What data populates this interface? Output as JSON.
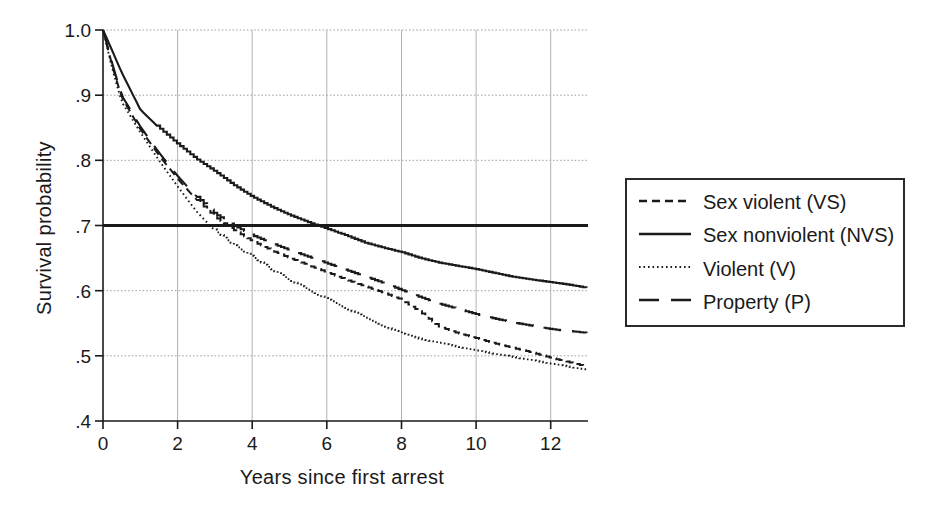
{
  "figure": {
    "colors": {
      "ink": "#1a1a1a",
      "grid_vertical": "#b2b2b2",
      "grid_horizontal": "#9a9a9a",
      "background": "#ffffff"
    }
  },
  "chart_data": {
    "type": "line",
    "title": "",
    "xlabel": "Years since first arrest",
    "ylabel": "Survival probability",
    "xlim": [
      0,
      13
    ],
    "ylim": [
      0.4,
      1.0
    ],
    "x_ticks": [
      0,
      2,
      4,
      6,
      8,
      10,
      12
    ],
    "x_tick_labels": [
      "0",
      "2",
      "4",
      "6",
      "8",
      "10",
      "12"
    ],
    "y_ticks": [
      1.0,
      0.9,
      0.8,
      0.7,
      0.6,
      0.5,
      0.4
    ],
    "y_tick_labels": [
      "1.0",
      ".9",
      ".8",
      ".7",
      ".6",
      ".5",
      ".4"
    ],
    "grid": true,
    "reference_line_y": 0.7,
    "legend_position": "right of plot",
    "x": [
      0,
      0.25,
      0.5,
      1,
      1.5,
      2,
      2.5,
      3,
      3.5,
      4,
      4.5,
      5,
      5.5,
      6,
      6.5,
      7,
      7.5,
      8,
      8.5,
      9,
      9.5,
      10,
      10.5,
      11,
      11.5,
      12,
      12.5,
      13
    ],
    "series": [
      {
        "name": "Sex violent (VS)",
        "style": "dashed",
        "values": [
          1.0,
          0.945,
          0.897,
          0.848,
          0.808,
          0.772,
          0.74,
          0.713,
          0.693,
          0.676,
          0.662,
          0.65,
          0.639,
          0.628,
          0.617,
          0.607,
          0.597,
          0.586,
          0.567,
          0.545,
          0.535,
          0.527,
          0.519,
          0.512,
          0.505,
          0.497,
          0.49,
          0.483
        ]
      },
      {
        "name": "Sex nonviolent (NVS)",
        "style": "solid",
        "values": [
          1.0,
          0.968,
          0.935,
          0.878,
          0.85,
          0.825,
          0.802,
          0.783,
          0.762,
          0.744,
          0.729,
          0.716,
          0.705,
          0.695,
          0.685,
          0.674,
          0.666,
          0.659,
          0.65,
          0.643,
          0.638,
          0.633,
          0.627,
          0.621,
          0.617,
          0.613,
          0.609,
          0.604
        ]
      },
      {
        "name": "Violent (V)",
        "style": "dotted",
        "values": [
          1.0,
          0.94,
          0.89,
          0.843,
          0.8,
          0.76,
          0.722,
          0.692,
          0.67,
          0.652,
          0.633,
          0.616,
          0.601,
          0.587,
          0.573,
          0.559,
          0.546,
          0.534,
          0.526,
          0.52,
          0.514,
          0.508,
          0.503,
          0.498,
          0.493,
          0.488,
          0.483,
          0.478
        ]
      },
      {
        "name": "Property (P)",
        "style": "longdash",
        "values": [
          1.0,
          0.948,
          0.9,
          0.852,
          0.812,
          0.776,
          0.745,
          0.718,
          0.7,
          0.685,
          0.673,
          0.662,
          0.652,
          0.642,
          0.632,
          0.622,
          0.612,
          0.601,
          0.59,
          0.58,
          0.572,
          0.564,
          0.557,
          0.551,
          0.546,
          0.541,
          0.538,
          0.535
        ]
      }
    ]
  }
}
